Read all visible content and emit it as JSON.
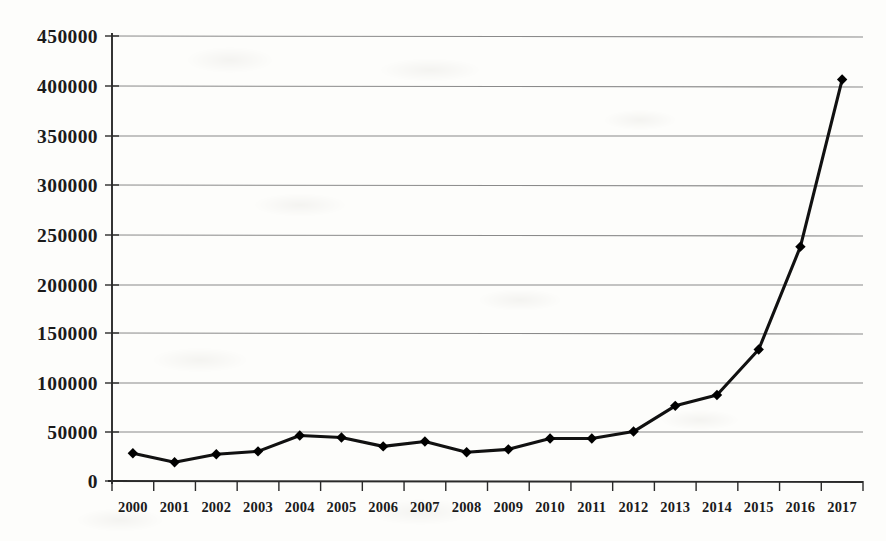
{
  "chart_data": {
    "type": "line",
    "title": "",
    "xlabel": "",
    "ylabel": "",
    "categories": [
      "2000",
      "2001",
      "2002",
      "2003",
      "2004",
      "2005",
      "2006",
      "2007",
      "2008",
      "2009",
      "2010",
      "2011",
      "2012",
      "2013",
      "2014",
      "2015",
      "2016",
      "2017"
    ],
    "values": [
      28000,
      19000,
      27000,
      30000,
      46000,
      44000,
      35000,
      40000,
      29000,
      32000,
      43000,
      43000,
      50000,
      76000,
      87000,
      133000,
      237000,
      406000
    ],
    "series": [
      {
        "name": "series-1",
        "values": [
          28000,
          19000,
          27000,
          30000,
          46000,
          44000,
          35000,
          40000,
          29000,
          32000,
          43000,
          43000,
          50000,
          76000,
          87000,
          133000,
          237000,
          406000
        ]
      }
    ],
    "ylim": [
      0,
      450000
    ],
    "ytick_labels": [
      "0",
      "50000",
      "100000",
      "150000",
      "200000",
      "250000",
      "300000",
      "350000",
      "400000",
      "450000"
    ],
    "ytick_values": [
      0,
      50000,
      100000,
      150000,
      200000,
      250000,
      300000,
      350000,
      400000,
      450000
    ],
    "xtick_labels": [
      "2000",
      "2001",
      "2002",
      "2003",
      "2004",
      "2005",
      "2006",
      "2007",
      "2008",
      "2009",
      "2010",
      "2011",
      "2012",
      "2013",
      "2014",
      "2015",
      "2016",
      "2017"
    ],
    "grid": "horizontal",
    "legend": "none",
    "marker": "diamond",
    "line_color": "#111111",
    "marker_color": "#000000",
    "gridline_color": "#8a8a8a",
    "axis_color": "#2a2a2a",
    "background_color": "#fdfdfb"
  }
}
